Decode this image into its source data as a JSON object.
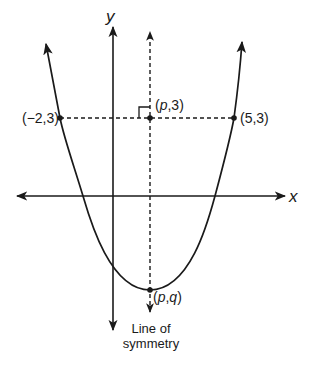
{
  "diagram": {
    "type": "parabola-graph",
    "axes": {
      "x_label": "x",
      "y_label": "y"
    },
    "points": [
      {
        "id": "left-point",
        "label": "(−2,3)"
      },
      {
        "id": "top-point",
        "label_open": "(",
        "label_var": "p",
        "label_rest": ",3)"
      },
      {
        "id": "right-point",
        "label": "(5,3)"
      },
      {
        "id": "vertex",
        "label_open": "(",
        "label_var1": "p",
        "label_comma": ",",
        "label_var2": "q",
        "label_close": ")"
      }
    ],
    "symmetry_label_line1": "Line of",
    "symmetry_label_line2": "symmetry",
    "colors": {
      "ink": "#1a1a1a",
      "background": "#ffffff"
    }
  }
}
